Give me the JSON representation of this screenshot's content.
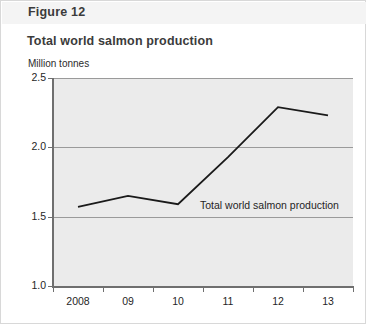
{
  "figure": {
    "label": "Figure 12"
  },
  "chart_title": "Total world salmon production",
  "axis": {
    "y_caption": "Million tonnes"
  },
  "series_inline_label": "Total world salmon production",
  "colors": {
    "plot_background": "#ebebeb",
    "gridline": "#9a9a9a",
    "axis": "#6f6f6f",
    "series_line": "#1a1a1a",
    "title_text": "#3b3b3b",
    "band_background": "#f4f4f4",
    "page_border": "#d8d8d8"
  },
  "chart_data": {
    "type": "line",
    "title": "Total world salmon production",
    "xlabel": "",
    "ylabel": "Million tonnes",
    "categories": [
      "2008",
      "09",
      "10",
      "11",
      "12",
      "13"
    ],
    "x_tick_labels": [
      "2008",
      "09",
      "10",
      "11",
      "12",
      "13"
    ],
    "y_tick_labels": [
      "1.0",
      "1.5",
      "2.0",
      "2.5"
    ],
    "y_tick_values": [
      1.0,
      1.5,
      2.0,
      2.5
    ],
    "ylim": [
      1.0,
      2.5
    ],
    "grid": true,
    "gridlines_at": [
      1.5,
      2.0,
      2.5
    ],
    "legend": "inline",
    "legend_position": "inline-right-of-2010-point",
    "series": [
      {
        "name": "Total world salmon production",
        "values": [
          1.57,
          1.65,
          1.59,
          1.93,
          2.29,
          2.23
        ]
      }
    ]
  }
}
